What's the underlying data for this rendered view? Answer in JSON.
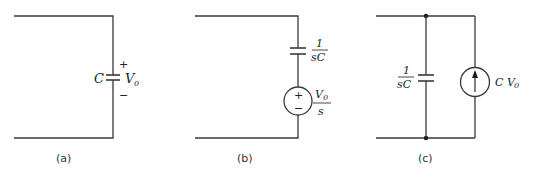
{
  "figure": {
    "panels": [
      {
        "id": "a",
        "caption": "(a)",
        "capacitor_label": "C",
        "voltage_label": "V",
        "voltage_sub": "0",
        "plus": "+",
        "minus": "−"
      },
      {
        "id": "b",
        "caption": "(b)",
        "impedance_num": "1",
        "impedance_den": "sC",
        "source_num_main": "V",
        "source_num_sub": "0",
        "source_den": "s",
        "plus": "+",
        "minus": "−"
      },
      {
        "id": "c",
        "caption": "(c)",
        "impedance_num": "1",
        "impedance_den": "sC",
        "current_label": "C V",
        "current_sub": "0"
      }
    ]
  }
}
